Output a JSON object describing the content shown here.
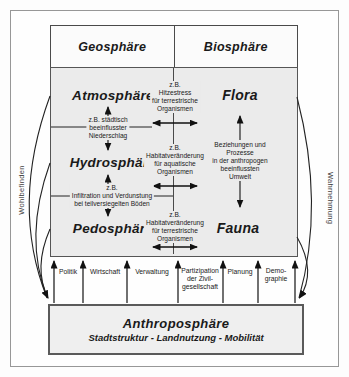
{
  "diagram": {
    "headers": {
      "left": "Geosphäre",
      "right": "Biosphäre"
    },
    "spheres": {
      "atmosphere": "Atmosphäre",
      "hydrosphere": "Hydrosphäre",
      "pedosphere": "Pedosphäre",
      "flora": "Flora",
      "fauna": "Fauna"
    },
    "process_labels": {
      "heat_stress": "z.B.\nHitzestress\nfür terrestrische\nOrganismen",
      "urban_precipitation": "z.B. städtisch\nbeeinflusster\nNiederschlag",
      "aquatic_habitat": "z.B.\nHabitatveränderung\nfür aquatische\nOrganismen",
      "infiltration": "z.B.\nInfiltration und Verdunstung\nbei teilversiegelten Böden",
      "terrestrial_habitat": "z.B.\nHabitatveränderung\nfür terrestrische\nOrganismen",
      "relations": "Beziehungen und\nProzesse\nin der anthropogen\nbeeinflussten\nUmwelt"
    },
    "society_labels": [
      "Politik",
      "Wirtschaft",
      "Verwaltung",
      "Partizipation\nder Zivil-\ngesellschaft",
      "Planung",
      "Demo-\ngraphie"
    ],
    "anthroposphere": {
      "title": "Anthroposphäre",
      "subtitle": "Stadtstruktur - Landnutzung - Mobilität"
    },
    "side_labels": {
      "left": "Wohlbefinden",
      "right": "Wahrnehmung"
    },
    "colors": {
      "box_fill": "#ebebeb",
      "line": "#1a1a1a",
      "frame": "#979797"
    }
  }
}
